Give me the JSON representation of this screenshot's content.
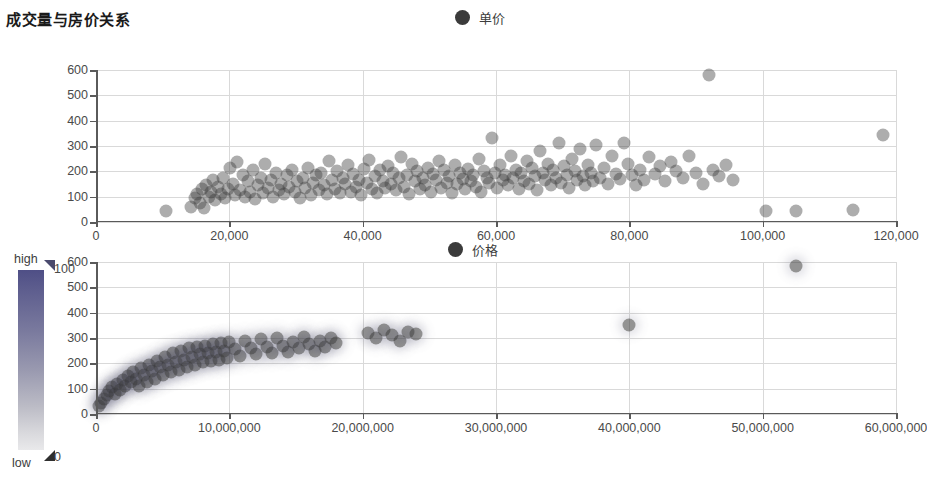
{
  "header": {
    "title": "成交量与房价关系"
  },
  "legends": {
    "top": {
      "label": "单价",
      "marker_color": "#3b3b3b",
      "icon": "circle-marker-icon"
    },
    "bottom": {
      "label": "价格",
      "marker_color": "#3b3b3b",
      "icon": "circle-marker-icon"
    }
  },
  "color_legend": {
    "high_label": "high",
    "low_label": "low",
    "max_value": "100",
    "min_value": "0",
    "gradient_top": "#4f4f86",
    "gradient_bottom": "#e9e9eb"
  },
  "chart_data": [
    {
      "type": "scatter",
      "title": "成交量与房价关系",
      "xlabel": "",
      "ylabel": "",
      "legend": "单价",
      "legend_position": "top-center",
      "grid": true,
      "xlim": [
        0,
        120000
      ],
      "ylim": [
        0,
        600
      ],
      "xticks": [
        0,
        20000,
        40000,
        60000,
        80000,
        100000,
        120000
      ],
      "xticklabels": [
        "0",
        "20,000",
        "40,000",
        "60,000",
        "80,000",
        "100,000",
        "120,000"
      ],
      "yticks": [
        0,
        100,
        200,
        300,
        400,
        500,
        600
      ],
      "yticklabels": [
        "0",
        "100",
        "200",
        "300",
        "400",
        "500",
        "600"
      ],
      "marker_color": "#3b3b3b",
      "marker_opacity": 0.45,
      "points": [
        [
          10500,
          45
        ],
        [
          14200,
          60
        ],
        [
          14800,
          95
        ],
        [
          15200,
          110
        ],
        [
          15600,
          75
        ],
        [
          15900,
          130
        ],
        [
          16200,
          55
        ],
        [
          16500,
          145
        ],
        [
          16900,
          100
        ],
        [
          17200,
          120
        ],
        [
          17600,
          165
        ],
        [
          17900,
          85
        ],
        [
          18300,
          140
        ],
        [
          18700,
          110
        ],
        [
          19000,
          175
        ],
        [
          19400,
          95
        ],
        [
          19800,
          130
        ],
        [
          20100,
          215
        ],
        [
          20500,
          150
        ],
        [
          20900,
          105
        ],
        [
          21200,
          235
        ],
        [
          21600,
          125
        ],
        [
          22000,
          185
        ],
        [
          22400,
          100
        ],
        [
          22800,
          160
        ],
        [
          23100,
          120
        ],
        [
          23500,
          205
        ],
        [
          23900,
          90
        ],
        [
          24300,
          145
        ],
        [
          24700,
          175
        ],
        [
          25000,
          115
        ],
        [
          25400,
          230
        ],
        [
          25800,
          135
        ],
        [
          26200,
          165
        ],
        [
          26600,
          100
        ],
        [
          27000,
          195
        ],
        [
          27400,
          125
        ],
        [
          27800,
          150
        ],
        [
          28200,
          110
        ],
        [
          28600,
          185
        ],
        [
          29000,
          140
        ],
        [
          29400,
          205
        ],
        [
          29800,
          120
        ],
        [
          30200,
          160
        ],
        [
          30600,
          95
        ],
        [
          31000,
          175
        ],
        [
          31400,
          135
        ],
        [
          31800,
          215
        ],
        [
          32200,
          105
        ],
        [
          32600,
          155
        ],
        [
          33000,
          185
        ],
        [
          33400,
          125
        ],
        [
          33800,
          195
        ],
        [
          34200,
          145
        ],
        [
          34600,
          110
        ],
        [
          35000,
          240
        ],
        [
          35400,
          165
        ],
        [
          35800,
          130
        ],
        [
          36200,
          200
        ],
        [
          36600,
          115
        ],
        [
          37000,
          175
        ],
        [
          37400,
          150
        ],
        [
          37800,
          225
        ],
        [
          38200,
          120
        ],
        [
          38600,
          190
        ],
        [
          39000,
          140
        ],
        [
          39400,
          165
        ],
        [
          39800,
          105
        ],
        [
          40200,
          210
        ],
        [
          40600,
          155
        ],
        [
          41000,
          245
        ],
        [
          41400,
          130
        ],
        [
          41800,
          180
        ],
        [
          42200,
          115
        ],
        [
          42600,
          205
        ],
        [
          43000,
          160
        ],
        [
          43400,
          135
        ],
        [
          43800,
          220
        ],
        [
          44200,
          150
        ],
        [
          44600,
          195
        ],
        [
          45000,
          125
        ],
        [
          45400,
          175
        ],
        [
          45800,
          255
        ],
        [
          46200,
          140
        ],
        [
          46600,
          185
        ],
        [
          47000,
          110
        ],
        [
          47400,
          230
        ],
        [
          47800,
          160
        ],
        [
          48200,
          200
        ],
        [
          48600,
          130
        ],
        [
          49000,
          175
        ],
        [
          49400,
          145
        ],
        [
          49800,
          215
        ],
        [
          50200,
          120
        ],
        [
          50600,
          190
        ],
        [
          51000,
          165
        ],
        [
          51400,
          240
        ],
        [
          51800,
          135
        ],
        [
          52200,
          205
        ],
        [
          52600,
          155
        ],
        [
          53000,
          180
        ],
        [
          53400,
          115
        ],
        [
          53800,
          225
        ],
        [
          54200,
          150
        ],
        [
          54600,
          195
        ],
        [
          55000,
          170
        ],
        [
          55400,
          130
        ],
        [
          55800,
          210
        ],
        [
          56200,
          160
        ],
        [
          56600,
          185
        ],
        [
          57000,
          140
        ],
        [
          57400,
          250
        ],
        [
          57800,
          120
        ],
        [
          58200,
          200
        ],
        [
          58600,
          175
        ],
        [
          59000,
          155
        ],
        [
          59400,
          330
        ],
        [
          59800,
          195
        ],
        [
          60200,
          135
        ],
        [
          60600,
          225
        ],
        [
          61000,
          165
        ],
        [
          61400,
          185
        ],
        [
          61800,
          145
        ],
        [
          62200,
          260
        ],
        [
          62600,
          175
        ],
        [
          63000,
          205
        ],
        [
          63400,
          130
        ],
        [
          63800,
          195
        ],
        [
          64200,
          160
        ],
        [
          64600,
          240
        ],
        [
          65000,
          150
        ],
        [
          65400,
          215
        ],
        [
          65800,
          180
        ],
        [
          66200,
          125
        ],
        [
          66600,
          280
        ],
        [
          67000,
          195
        ],
        [
          67400,
          165
        ],
        [
          67800,
          230
        ],
        [
          68200,
          145
        ],
        [
          68600,
          205
        ],
        [
          69000,
          175
        ],
        [
          69400,
          310
        ],
        [
          69800,
          155
        ],
        [
          70200,
          220
        ],
        [
          70600,
          185
        ],
        [
          71000,
          135
        ],
        [
          71400,
          250
        ],
        [
          71800,
          200
        ],
        [
          72200,
          165
        ],
        [
          72600,
          290
        ],
        [
          73000,
          180
        ],
        [
          73400,
          145
        ],
        [
          73800,
          225
        ],
        [
          74200,
          195
        ],
        [
          74600,
          160
        ],
        [
          75000,
          305
        ],
        [
          75600,
          175
        ],
        [
          76200,
          215
        ],
        [
          76800,
          150
        ],
        [
          77400,
          260
        ],
        [
          78000,
          190
        ],
        [
          78600,
          170
        ],
        [
          79200,
          310
        ],
        [
          79800,
          230
        ],
        [
          80400,
          185
        ],
        [
          81000,
          145
        ],
        [
          81600,
          205
        ],
        [
          82200,
          165
        ],
        [
          83000,
          255
        ],
        [
          83800,
          190
        ],
        [
          84600,
          220
        ],
        [
          85400,
          160
        ],
        [
          86200,
          235
        ],
        [
          87000,
          200
        ],
        [
          88000,
          175
        ],
        [
          89000,
          260
        ],
        [
          90000,
          195
        ],
        [
          91000,
          150
        ],
        [
          92000,
          580
        ],
        [
          92500,
          205
        ],
        [
          93500,
          180
        ],
        [
          94500,
          225
        ],
        [
          95500,
          165
        ],
        [
          100500,
          45
        ],
        [
          105000,
          45
        ],
        [
          113500,
          48
        ],
        [
          118000,
          345
        ]
      ],
      "outliers": [
        {
          "x": 92000,
          "y": 580
        },
        {
          "x": 118000,
          "y": 345
        },
        {
          "x": 10500,
          "y": 45
        }
      ]
    },
    {
      "type": "scatter",
      "title": "",
      "xlabel": "",
      "ylabel": "",
      "legend": "价格",
      "legend_position": "top-center",
      "grid": true,
      "xlim": [
        0,
        60000000
      ],
      "ylim": [
        0,
        600
      ],
      "xticks": [
        0,
        10000000,
        20000000,
        30000000,
        40000000,
        50000000,
        60000000
      ],
      "xticklabels": [
        "0",
        "10,000,000",
        "20,000,000",
        "30,000,000",
        "40,000,000",
        "50,000,000",
        "60,000,000"
      ],
      "yticks": [
        0,
        100,
        200,
        300,
        400,
        500,
        600
      ],
      "yticklabels": [
        "0",
        "100",
        "200",
        "300",
        "400",
        "500",
        "600"
      ],
      "marker_color": "#3b3b3b",
      "marker_opacity": 0.5,
      "points": [
        [
          250000,
          30
        ],
        [
          400000,
          45
        ],
        [
          600000,
          60
        ],
        [
          800000,
          75
        ],
        [
          1000000,
          90
        ],
        [
          1200000,
          105
        ],
        [
          1400000,
          80
        ],
        [
          1600000,
          120
        ],
        [
          1800000,
          95
        ],
        [
          2000000,
          135
        ],
        [
          2200000,
          110
        ],
        [
          2400000,
          150
        ],
        [
          2600000,
          125
        ],
        [
          2800000,
          165
        ],
        [
          3000000,
          140
        ],
        [
          3200000,
          110
        ],
        [
          3400000,
          180
        ],
        [
          3600000,
          155
        ],
        [
          3800000,
          125
        ],
        [
          4000000,
          195
        ],
        [
          4200000,
          170
        ],
        [
          4400000,
          140
        ],
        [
          4600000,
          210
        ],
        [
          4800000,
          185
        ],
        [
          5000000,
          155
        ],
        [
          5200000,
          225
        ],
        [
          5400000,
          195
        ],
        [
          5600000,
          165
        ],
        [
          5800000,
          240
        ],
        [
          6000000,
          205
        ],
        [
          6200000,
          175
        ],
        [
          6400000,
          250
        ],
        [
          6600000,
          215
        ],
        [
          6800000,
          185
        ],
        [
          7000000,
          260
        ],
        [
          7200000,
          225
        ],
        [
          7400000,
          195
        ],
        [
          7600000,
          265
        ],
        [
          7800000,
          235
        ],
        [
          8000000,
          205
        ],
        [
          8200000,
          270
        ],
        [
          8400000,
          240
        ],
        [
          8600000,
          210
        ],
        [
          8800000,
          275
        ],
        [
          9000000,
          245
        ],
        [
          9200000,
          215
        ],
        [
          9400000,
          280
        ],
        [
          9600000,
          250
        ],
        [
          9800000,
          220
        ],
        [
          10000000,
          285
        ],
        [
          10400000,
          255
        ],
        [
          10800000,
          230
        ],
        [
          11200000,
          290
        ],
        [
          11600000,
          260
        ],
        [
          12000000,
          235
        ],
        [
          12400000,
          295
        ],
        [
          12800000,
          265
        ],
        [
          13200000,
          240
        ],
        [
          13600000,
          300
        ],
        [
          14000000,
          270
        ],
        [
          14400000,
          245
        ],
        [
          14800000,
          285
        ],
        [
          15200000,
          260
        ],
        [
          15600000,
          305
        ],
        [
          16000000,
          275
        ],
        [
          16400000,
          250
        ],
        [
          16800000,
          290
        ],
        [
          17200000,
          265
        ],
        [
          17600000,
          300
        ],
        [
          18000000,
          280
        ],
        [
          20400000,
          320
        ],
        [
          21000000,
          300
        ],
        [
          21600000,
          330
        ],
        [
          22200000,
          310
        ],
        [
          22800000,
          290
        ],
        [
          23400000,
          325
        ],
        [
          24000000,
          315
        ],
        [
          40000000,
          350
        ],
        [
          52500000,
          585
        ]
      ],
      "outliers": [
        {
          "x": 40000000,
          "y": 350
        },
        {
          "x": 52500000,
          "y": 585
        }
      ]
    }
  ]
}
